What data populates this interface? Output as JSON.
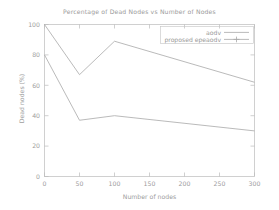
{
  "chart_data": {
    "type": "line",
    "title": "Percentage of Dead Nodes vs Number of Nodes",
    "xlabel": "Number of nodes",
    "ylabel": "Dead nodes (%)",
    "xlim": [
      0,
      300
    ],
    "ylim": [
      0,
      100
    ],
    "xticks": [
      0,
      50,
      100,
      150,
      200,
      250,
      300
    ],
    "xtick_labels": [
      "0",
      "50",
      "100",
      "150",
      "200",
      "250",
      "300"
    ],
    "yticks": [
      0,
      20,
      40,
      60,
      80,
      100
    ],
    "ytick_labels": [
      "0",
      "20",
      "40",
      "60",
      "80",
      "100"
    ],
    "grid": false,
    "legend_position": "top-right",
    "x": [
      0,
      50,
      100,
      300
    ],
    "series": [
      {
        "name": "aodv",
        "key_style": "line",
        "color": "#a8a8a8",
        "values": [
          100,
          67,
          89,
          62
        ]
      },
      {
        "name": "proposed epeaodv",
        "key_style": "line-plus-marker",
        "color": "#a8a8a8",
        "values": [
          80,
          37,
          40,
          30
        ]
      }
    ]
  },
  "legend": {
    "entries": [
      {
        "label": "aodv"
      },
      {
        "label": "proposed epeaodv"
      }
    ]
  },
  "colors": {
    "background": "#ffffff",
    "axis": "#b4b4b4",
    "text": "#9a9a9a",
    "line": "#a8a8a8"
  }
}
